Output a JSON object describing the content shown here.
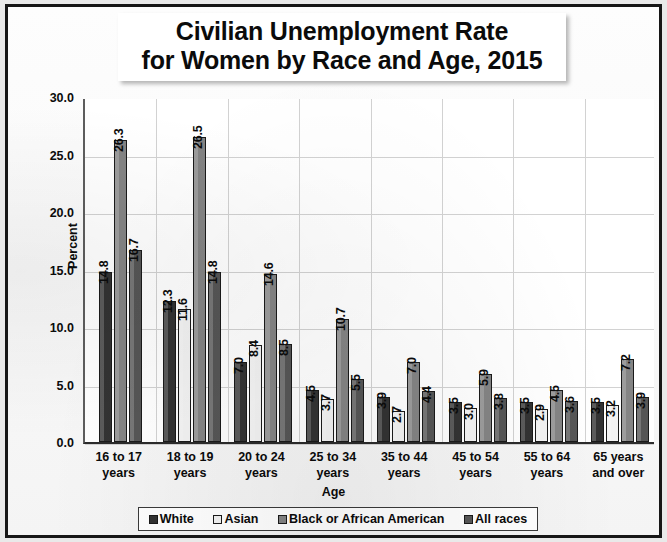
{
  "chart_data": {
    "type": "bar",
    "title": "Civilian Unemployment Rate for Women by Race and Age, 2015",
    "title_lines": [
      "Civilian Unemployment Rate",
      "for Women by Race and Age, 2015"
    ],
    "xlabel": "Age",
    "ylabel": "Percent",
    "ylim": [
      0,
      30
    ],
    "ytick_step": 5,
    "ytick_labels": [
      "30.0",
      "25.0",
      "20.0",
      "15.0",
      "10.0",
      "5.0",
      "0.0"
    ],
    "grid": true,
    "legend_position": "bottom",
    "categories": [
      "16 to 17 years",
      "18 to 19 years",
      "20 to 24 years",
      "25 to 34 years",
      "35 to 44 years",
      "45 to 54 years",
      "55 to 64 years",
      "65 years and over"
    ],
    "category_lines": [
      [
        "16 to 17",
        "years"
      ],
      [
        "18 to 19",
        "years"
      ],
      [
        "20 to 24",
        "years"
      ],
      [
        "25 to 34",
        "years"
      ],
      [
        "35 to 44",
        "years"
      ],
      [
        "45 to 54",
        "years"
      ],
      [
        "55 to 64",
        "years"
      ],
      [
        "65 years",
        "and over"
      ]
    ],
    "series": [
      {
        "name": "White",
        "color": "#333333",
        "values": [
          14.8,
          12.3,
          7.0,
          4.5,
          3.9,
          3.5,
          3.5,
          3.5
        ],
        "labels": [
          "14.8",
          "12.3",
          "7.0",
          "4.5",
          "3.9",
          "3.5",
          "3.5",
          "3.5"
        ]
      },
      {
        "name": "Asian",
        "color": "#f2f2f2",
        "values": [
          null,
          11.6,
          8.4,
          3.7,
          2.7,
          3.0,
          2.9,
          3.2
        ],
        "labels": [
          "",
          "11.6",
          "8.4",
          "3.7",
          "2.7",
          "3.0",
          "2.9",
          "3.2"
        ]
      },
      {
        "name": "Black or African American",
        "color": "#848484",
        "values": [
          26.3,
          26.5,
          14.6,
          10.7,
          7.0,
          5.9,
          4.5,
          7.2
        ],
        "labels": [
          "26.3",
          "26.5",
          "14.6",
          "10.7",
          "7.0",
          "5.9",
          "4.5",
          "7.2"
        ]
      },
      {
        "name": "All races",
        "color": "#565656",
        "values": [
          16.7,
          14.8,
          8.5,
          5.5,
          4.4,
          3.8,
          3.6,
          3.9
        ],
        "labels": [
          "16.7",
          "14.8",
          "8.5",
          "5.5",
          "4.4",
          "3.8",
          "3.6",
          "3.9"
        ]
      }
    ]
  }
}
